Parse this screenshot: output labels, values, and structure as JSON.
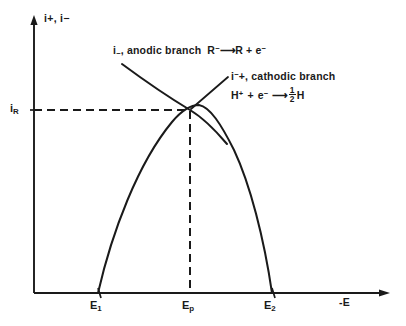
{
  "figure": {
    "background_color": "#ffffff",
    "ink_color": "#1a1a1a"
  },
  "axes": {
    "y_label": "i+, i−",
    "y_label_plain": "i+, i-",
    "x_label": "-E",
    "x_label_plain": "-E",
    "origin_px": {
      "x": 34,
      "y": 293
    },
    "x_axis_end_px": {
      "x": 390,
      "y": 293
    },
    "y_axis_top_px": {
      "x": 34,
      "y": 18
    }
  },
  "ticks": {
    "x": [
      {
        "id": "E1",
        "label_main": "E",
        "label_sub": "1",
        "x_px": 98
      },
      {
        "id": "Ep",
        "label_main": "E",
        "label_sub": "p",
        "x_px": 190
      },
      {
        "id": "E2",
        "label_main": "E",
        "label_sub": "2",
        "x_px": 272
      }
    ],
    "y": [
      {
        "id": "iR",
        "label_main": "i",
        "label_sub": "R",
        "y_px": 110
      }
    ]
  },
  "annotations": {
    "anodic": {
      "name": "anodic-branch-annotation",
      "species_label_main": "i",
      "species_label_sub": "−",
      "text": "i−, anodic  branch",
      "prefix": "i",
      "subscript": "−",
      "body": ", anodic  branch",
      "reaction": {
        "left": "R",
        "left_sup": "−",
        "arrow": "⟶",
        "right": "R + e",
        "right_sup": "−",
        "full": "R− ⟶ R + e−"
      },
      "pos_px": {
        "x": 113,
        "y": 48
      },
      "leader_from_px": {
        "x": 122,
        "y": 64
      }
    },
    "cathodic": {
      "name": "cathodic-branch-annotation",
      "text": "i+, cathodic  branch",
      "prefix": "i",
      "superscript": "−",
      "body": "+, cathodic  branch",
      "reaction": {
        "left": "H",
        "left_sup": "+",
        "plus": "+",
        "electron": "e",
        "electron_sup": "−",
        "arrow": "⟶",
        "product_num": "1",
        "product_den": "2",
        "product": "H",
        "full": "H+ + e− ⟶ ½H"
      },
      "pos_px": {
        "x": 231,
        "y": 74
      },
      "leader_from_px": {
        "x": 190,
        "y": 110
      }
    }
  },
  "curves": [
    {
      "name": "cathodic-branch-curve",
      "style": "solid",
      "description": "Parabolic arc rising from E1 on the axis, peaking near Ep, falling to E2 on the axis",
      "points_px": [
        [
          98,
          293
        ],
        [
          103,
          262
        ],
        [
          110,
          233
        ],
        [
          119,
          207
        ],
        [
          130,
          182
        ],
        [
          143,
          158
        ],
        [
          158,
          136
        ],
        [
          172,
          120
        ],
        [
          183,
          111
        ],
        [
          190,
          107
        ],
        [
          199,
          105
        ],
        [
          210,
          110
        ],
        [
          222,
          124
        ],
        [
          234,
          146
        ],
        [
          245,
          172
        ],
        [
          255,
          201
        ],
        [
          263,
          231
        ],
        [
          269,
          262
        ],
        [
          272,
          293
        ]
      ]
    },
    {
      "name": "anodic-branch-curve",
      "style": "solid",
      "description": "Gently concave line descending from upper-left, crossing the cathodic curve at Ep, continuing down-right",
      "points_px": [
        [
          122,
          64
        ],
        [
          138,
          75
        ],
        [
          154,
          87
        ],
        [
          168,
          97
        ],
        [
          180,
          104
        ],
        [
          190,
          110
        ],
        [
          202,
          119
        ],
        [
          214,
          130
        ],
        [
          226,
          143
        ]
      ]
    }
  ],
  "dashed_lines": [
    {
      "name": "iR-horizontal-dashed-line",
      "orientation": "horizontal",
      "from_px": {
        "x": 34,
        "y": 110
      },
      "to_px": {
        "x": 190,
        "y": 110
      }
    },
    {
      "name": "Ep-vertical-dashed-line",
      "orientation": "vertical",
      "from_px": {
        "x": 190,
        "y": 110
      },
      "to_px": {
        "x": 190,
        "y": 293
      }
    }
  ],
  "leader_lines": [
    {
      "name": "cathodic-leader-line",
      "from_px": {
        "x": 190,
        "y": 110
      },
      "to_px": {
        "x": 228,
        "y": 77
      }
    }
  ]
}
